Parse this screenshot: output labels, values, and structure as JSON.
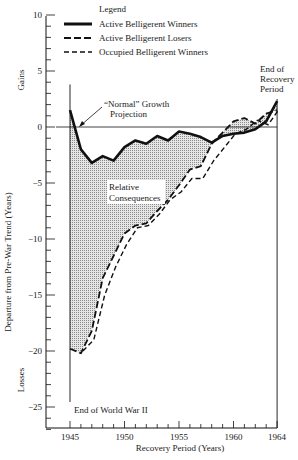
{
  "chart_data": {
    "type": "line",
    "title": "",
    "xlabel": "Recovery Period (Years)",
    "ylabel": "Departure from Pre-War Trend (Years)",
    "ylabel_top": "Gains",
    "ylabel_bottom": "Losses",
    "xlim": [
      1945,
      1964
    ],
    "ylim": [
      -27,
      10
    ],
    "x_ticks": [
      "1945",
      "1950",
      "1955",
      "1960",
      "1964"
    ],
    "y_ticks": [
      "10",
      "5",
      "0",
      "-5",
      "-10",
      "-15",
      "-20",
      "-25"
    ],
    "legend": {
      "title": "Legend",
      "entries": [
        "Active Belligerent Winners",
        "Active Belligerent Losers",
        "Occupied Belligerent Winners"
      ],
      "position": "top"
    },
    "annotations": [
      "“Normal” Growth Projection",
      "Relative Consequences",
      "End of Recovery Period",
      "End of World War II"
    ],
    "grid": false,
    "x": [
      1945,
      1946,
      1947,
      1948,
      1949,
      1950,
      1951,
      1952,
      1953,
      1954,
      1955,
      1956,
      1957,
      1958,
      1959,
      1960,
      1961,
      1962,
      1963,
      1964
    ],
    "series": [
      {
        "name": "Active Belligerent Winners",
        "style": "solid",
        "values": [
          1.5,
          -2.0,
          -3.2,
          -2.6,
          -3.0,
          -1.8,
          -1.2,
          -1.5,
          -0.8,
          -1.2,
          -0.4,
          -0.6,
          -0.9,
          -1.4,
          -0.8,
          -0.6,
          -0.5,
          -0.2,
          0.5,
          2.3
        ]
      },
      {
        "name": "Active Belligerent Losers",
        "style": "long-dash",
        "values": [
          -19.8,
          -20.2,
          -18.2,
          -13.5,
          -11.5,
          -9.5,
          -8.8,
          -8.6,
          -7.5,
          -6.5,
          -5.2,
          -3.8,
          -3.5,
          -1.5,
          -0.5,
          0.5,
          0.8,
          0.3,
          1.2,
          1.5
        ]
      },
      {
        "name": "Occupied Belligerent Winners",
        "style": "short-dash",
        "values": [
          null,
          -20.0,
          -19.0,
          -15.0,
          -12.5,
          -10.5,
          -9.0,
          -8.8,
          -7.8,
          -6.5,
          -5.8,
          -4.6,
          -4.6,
          -3.0,
          -1.8,
          -0.6,
          -0.2,
          0.6,
          0.2,
          1.6
        ]
      }
    ]
  },
  "labels": {
    "legend_title": "Legend",
    "legend_1": "Active Belligerent Winners",
    "legend_2": "Active Belligerent Losers",
    "legend_3": "Occupied Belligerent Winners",
    "gains": "Gains",
    "losses": "Losses",
    "ylabel": "Departure from Pre-War Trend (Years)",
    "xlabel": "Recovery Period (Years)",
    "normal_1": "“Normal” Growth",
    "normal_2": "Projection",
    "relative_1": "Relative",
    "relative_2": "Consequences",
    "end_rec_1": "End of",
    "end_rec_2": "Recovery",
    "end_rec_3": "Period",
    "end_ww2": "End of World War II"
  }
}
